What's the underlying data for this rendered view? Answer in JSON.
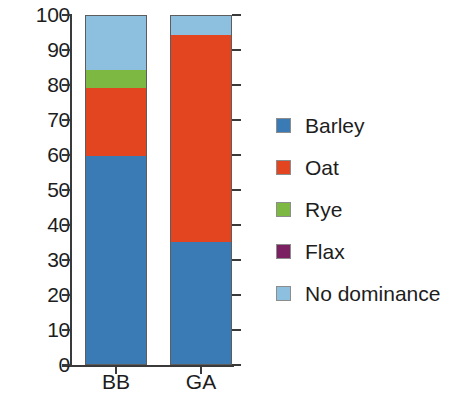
{
  "chart_data": {
    "type": "bar",
    "subtype": "stacked-column-100",
    "title": "",
    "xlabel": "",
    "ylabel": "",
    "categories": [
      "BB",
      "GA"
    ],
    "ylim": [
      0,
      100
    ],
    "yticks": [
      0,
      10,
      20,
      30,
      40,
      50,
      60,
      70,
      80,
      90,
      100
    ],
    "ytick_labels": [
      "0",
      "10",
      "20",
      "30",
      "40",
      "50",
      "60",
      "70",
      "80",
      "90",
      "100"
    ],
    "grid": false,
    "legend_position": "right",
    "series": [
      {
        "name": "Barley",
        "color": "#3a7ab5",
        "values": [
          60.0,
          35.5
        ]
      },
      {
        "name": "Oat",
        "color": "#e2451f",
        "values": [
          19.5,
          59.0
        ]
      },
      {
        "name": "Rye",
        "color": "#7cb842",
        "values": [
          5.0,
          0.0
        ]
      },
      {
        "name": "Flax",
        "color": "#7b2060",
        "values": [
          0.0,
          0.0
        ]
      },
      {
        "name": "No dominance",
        "color": "#8cc0de",
        "values": [
          15.5,
          5.5
        ]
      }
    ]
  },
  "axis": {
    "tick_labels": [
      "100",
      "90",
      "80",
      "70",
      "60",
      "50",
      "40",
      "30",
      "20",
      "10",
      "0"
    ],
    "category_labels": [
      "BB",
      "GA"
    ]
  },
  "legend": {
    "items": [
      {
        "label": "Barley",
        "color": "#3a7ab5",
        "icon": "legend-swatch-square"
      },
      {
        "label": "Oat",
        "color": "#e2451f",
        "icon": "legend-swatch-square"
      },
      {
        "label": "Rye",
        "color": "#7cb842",
        "icon": "legend-swatch-square"
      },
      {
        "label": "Flax",
        "color": "#7b2060",
        "icon": "legend-swatch-square"
      },
      {
        "label": "No dominance",
        "color": "#8cc0de",
        "icon": "legend-swatch-square"
      }
    ]
  }
}
